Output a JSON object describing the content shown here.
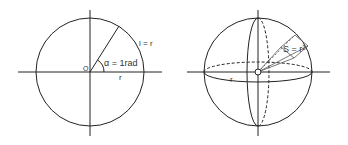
{
  "colors": {
    "stroke": "#222222",
    "text": "#333333",
    "background": "#ffffff"
  },
  "radian_diagram": {
    "origin_label": "O",
    "angle_label": "α = 1rad",
    "arc_label": "l = r",
    "radius_label": "r"
  },
  "steradian_diagram": {
    "area_label": "S = r²",
    "radius_label": "r"
  }
}
